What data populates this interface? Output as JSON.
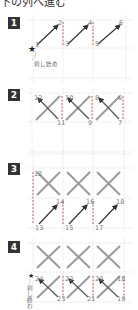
{
  "title": "下の列へ進む",
  "steps": [
    {
      "badge": "1",
      "numbers": [
        "1",
        "2",
        "3",
        "4",
        "5",
        "6"
      ],
      "start_label": "刺し始め"
    },
    {
      "badge": "2",
      "numbers": [
        "12",
        "11",
        "10",
        "9",
        "8",
        "7",
        "6"
      ]
    },
    {
      "badge": "3",
      "numbers": [
        "12",
        "13",
        "14",
        "15",
        "16",
        "17",
        "18"
      ]
    },
    {
      "badge": "4",
      "numbers": [
        "24",
        "23",
        "22",
        "21",
        "20",
        "19",
        "18"
      ],
      "end_label": "刺し終わり"
    }
  ],
  "colors": {
    "grid": "#d0d0d0",
    "stitch": "#999999",
    "arrow": "#333333",
    "dashed_back": "#c06060",
    "badge_bg": "#333333"
  }
}
